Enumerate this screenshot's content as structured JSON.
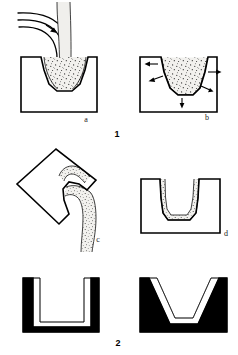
{
  "figure": {
    "background_color": "#ffffff",
    "ink_color": "#000000",
    "melt_fill_color": "#f0efec",
    "width": 238,
    "height": 355
  },
  "figures": [
    {
      "number_label": "1",
      "caption": "1",
      "panels": [
        {
          "key": "a",
          "label": "a",
          "description": "Molten metal poured from a ladle spout into an open mold cavity",
          "elements": [
            "ladle-spout",
            "pour-arrow",
            "pouring-stream",
            "mold-body",
            "molten-metal-pool"
          ]
        },
        {
          "key": "b",
          "label": "b",
          "description": "Heat extracted outward through the mold walls while the melt solidifies at the surface",
          "elements": [
            "mold-body",
            "molten-metal-pool",
            "heat-flow-arrows"
          ],
          "arrow_count": 6,
          "arrow_directions": [
            "left",
            "left",
            "right",
            "right",
            "down",
            "right-down"
          ]
        },
        {
          "key": "c",
          "label": "c",
          "description": "Mold inverted so the still-liquid centre drains out, leaving a solidified shell",
          "elements": [
            "mold-body-rotated",
            "draining-stream",
            "solidified-shell"
          ],
          "rotation_degrees": -45
        },
        {
          "key": "d",
          "label": "d",
          "description": "Finished hollow casting: a thin solidified shell lines the mold cavity",
          "elements": [
            "mold-body",
            "solidified-shell-lining"
          ]
        }
      ]
    },
    {
      "number_label": "2",
      "caption": "2",
      "panels": [
        {
          "key": "left",
          "label": "",
          "description": "Cross-section of a hollow casting with straight parallel walls and a rounded base",
          "elements": [
            "casting-wall-u-shape"
          ],
          "profile": "U-shaped / parallel-sided"
        },
        {
          "key": "right",
          "label": "",
          "description": "Cross-section of a hollow casting with tapered walls giving a V-shaped cavity",
          "elements": [
            "casting-wall-v-shape"
          ],
          "profile": "V-shaped / tapered"
        }
      ]
    }
  ],
  "labels": {
    "a": "a",
    "b": "b",
    "c": "c",
    "d": "d",
    "fig1": "1",
    "fig2": "2"
  }
}
